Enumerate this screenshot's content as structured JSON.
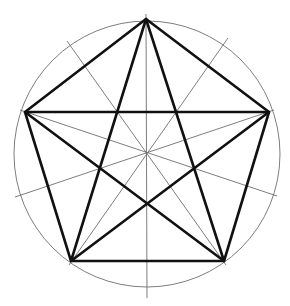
{
  "diagram": {
    "title": "",
    "colors": {
      "background": "#ffffff",
      "thick_line": "#111111",
      "thin_line": "#6e6e6e"
    },
    "circle": {
      "cx": 147,
      "cy": 154,
      "r": 133
    },
    "vertices": [
      {
        "name": "top",
        "x": 146,
        "y": 19
      },
      {
        "name": "right",
        "x": 269,
        "y": 112
      },
      {
        "name": "bottom-right",
        "x": 224,
        "y": 261
      },
      {
        "name": "bottom-left",
        "x": 71,
        "y": 261
      },
      {
        "name": "left",
        "x": 25,
        "y": 112
      }
    ],
    "axes": [
      {
        "x1": 146,
        "y1": 14,
        "x2": 147,
        "y2": 298
      },
      {
        "x1": 67,
        "y1": 41,
        "x2": 226,
        "y2": 265
      },
      {
        "x1": 228,
        "y1": 38,
        "x2": 69,
        "y2": 265
      },
      {
        "x1": 15,
        "y1": 197,
        "x2": 274,
        "y2": 110
      },
      {
        "x1": 277,
        "y1": 196,
        "x2": 20,
        "y2": 110
      }
    ]
  }
}
